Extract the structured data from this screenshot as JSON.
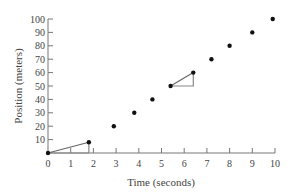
{
  "chart_data": {
    "type": "scatter",
    "title": "",
    "xlabel": "Time (seconds)",
    "ylabel": "Position (meters)",
    "xlim": [
      0,
      10
    ],
    "ylim": [
      0,
      100
    ],
    "xticks": [
      0,
      1,
      2,
      3,
      4,
      5,
      6,
      7,
      8,
      9,
      10
    ],
    "yticks": [
      10,
      20,
      30,
      40,
      50,
      60,
      70,
      80,
      90,
      100
    ],
    "grid": false,
    "legend": null,
    "series": [
      {
        "name": "position",
        "x": [
          0,
          1.8,
          2.9,
          3.8,
          4.6,
          5.4,
          6.4,
          7.2,
          8.0,
          9.0,
          9.9
        ],
        "y": [
          0,
          8,
          20,
          30,
          40,
          50,
          60,
          70,
          80,
          90,
          100
        ]
      }
    ],
    "annotations": [
      {
        "type": "slope-triangle",
        "from": [
          0,
          0
        ],
        "to": [
          1.8,
          8
        ]
      },
      {
        "type": "slope-triangle",
        "from": [
          5.4,
          50
        ],
        "to": [
          6.4,
          60
        ]
      }
    ]
  }
}
